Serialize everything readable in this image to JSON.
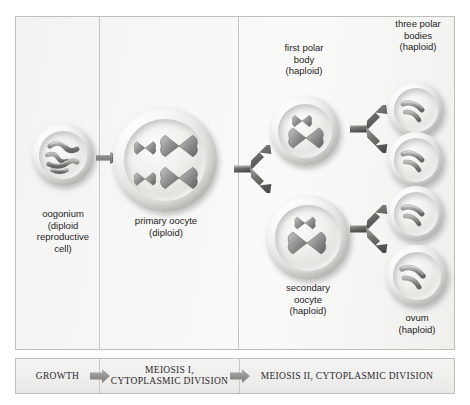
{
  "diagram": {
    "frame_border_color": "#bfbfbd",
    "background_color": "#f5f5f3",
    "chromosome_color": "#8c8c8c"
  },
  "cells": [
    {
      "id": "oogonium",
      "label": "oogonium\n(diploid\nreproductive\ncell)",
      "label_lines": [
        "oogonium",
        "(diploid",
        "reproductive",
        "cell)"
      ],
      "ploidy": "diploid",
      "chromosome_shape": "wavy",
      "chromosome_count": 4
    },
    {
      "id": "primary-oocyte",
      "label_lines": [
        "primary oocyte",
        "(diploid)"
      ],
      "ploidy": "diploid",
      "chromosome_shape": "x-shaped",
      "chromosome_count": 4
    },
    {
      "id": "first-polar-body",
      "label_lines": [
        "first polar",
        "body",
        "(haploid)"
      ],
      "ploidy": "haploid",
      "chromosome_shape": "x-shaped",
      "chromosome_count": 2
    },
    {
      "id": "secondary-oocyte",
      "label_lines": [
        "secondary",
        "oocyte",
        "(haploid)"
      ],
      "ploidy": "haploid",
      "chromosome_shape": "x-shaped",
      "chromosome_count": 2
    },
    {
      "id": "three-polar-bodies",
      "label_lines": [
        "three polar",
        "bodies",
        "(haploid)"
      ],
      "ploidy": "haploid",
      "chromosome_shape": "curved",
      "chromosome_count": 2,
      "cell_count": 3
    },
    {
      "id": "ovum",
      "label_lines": [
        "ovum",
        "(haploid)"
      ],
      "ploidy": "haploid",
      "chromosome_shape": "curved",
      "chromosome_count": 2
    }
  ],
  "labels": {
    "oogonium": "oogonium\n(diploid\nreproductive\ncell)",
    "oogonium_l1": "oogonium",
    "oogonium_l2": "(diploid",
    "oogonium_l3": "reproductive",
    "oogonium_l4": "cell)",
    "primary_oocyte_l1": "primary oocyte",
    "primary_oocyte_l2": "(diploid)",
    "first_polar_body_l1": "first polar",
    "first_polar_body_l2": "body",
    "first_polar_body_l3": "(haploid)",
    "secondary_oocyte_l1": "secondary",
    "secondary_oocyte_l2": "oocyte",
    "secondary_oocyte_l3": "(haploid)",
    "three_polar_bodies_l1": "three polar",
    "three_polar_bodies_l2": "bodies",
    "three_polar_bodies_l3": "(haploid)",
    "ovum_l1": "ovum",
    "ovum_l2": "(haploid)"
  },
  "phases": {
    "growth": "GROWTH",
    "meiosis_1_l1": "MEIOSIS I,",
    "meiosis_1_l2": "CYTOPLASMIC DIVISION",
    "meiosis_2": "MEIOSIS II,  CYTOPLASMIC DIVISION"
  }
}
